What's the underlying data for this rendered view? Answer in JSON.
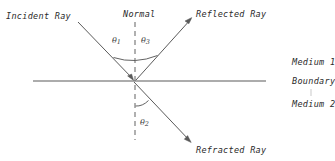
{
  "diagram": {
    "stroke_color": "#4a4a4a",
    "text_color": "#2b2b2b",
    "background_color": "#ffffff",
    "labels": {
      "incident_ray": "Incident Ray",
      "normal": "Normal",
      "reflected_ray": "Reflected Ray",
      "refracted_ray": "Refracted Ray",
      "medium_1": "Medium 1",
      "boundary": "Boundary",
      "medium_2": "Medium 2"
    },
    "angles": {
      "theta_1_symbol": "θ",
      "theta_1_sub": "1",
      "theta_3_symbol": "θ",
      "theta_3_sub": "3",
      "theta_2_symbol": "θ",
      "theta_2_sub": "2"
    }
  }
}
